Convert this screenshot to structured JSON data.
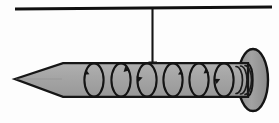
{
  "figure": {
    "caption": "",
    "background_color": "#fdfdfd",
    "canvas": {
      "width": 279,
      "height": 123
    }
  },
  "colors": {
    "outline": "#1a1a1a",
    "body_fill": "#a3a3a3",
    "head_fill": "#9b9b9b",
    "head_rim": "#141414",
    "support_line": "#101010",
    "string": "#151515",
    "loop_stroke": "#141414",
    "background": "#fdfdfd"
  },
  "elements": {
    "support_line": {
      "name": "horizontal support line",
      "x1": 15,
      "y1": 9,
      "x2": 272,
      "y2": 7,
      "thickness": 3
    },
    "string": {
      "name": "vertical suspension string",
      "x": 152,
      "y_top": 9,
      "y_bottom": 64,
      "thickness": 2,
      "anchor_cap_width": 9
    },
    "nail_shaft": {
      "name": "nail shaft",
      "top_y": 63,
      "bottom_y": 97,
      "left_x": 57,
      "right_x": 248
    },
    "nail_tip": {
      "name": "nail point",
      "apex_x": 15,
      "apex_y": 79,
      "base_x": 62
    },
    "nail_head": {
      "name": "nail head",
      "center_x": 253,
      "center_y": 80,
      "radius_x": 15,
      "radius_y": 31
    },
    "shank_grooves": {
      "name": "shank ring grooves",
      "count": 3,
      "x_positions": [
        238,
        242,
        246
      ]
    }
  },
  "circulation_loops": {
    "name": "circulation direction loops",
    "count": 6,
    "radius_x": 10,
    "radius_y": 17,
    "direction": "counterclockwise",
    "items": [
      {
        "label": "loop-1",
        "cx": 94,
        "cy": 80,
        "arrow": "top-left"
      },
      {
        "label": "loop-2",
        "cx": 121,
        "cy": 80,
        "arrow": "top-right"
      },
      {
        "label": "loop-3",
        "cx": 147,
        "cy": 80,
        "arrow": "mid-left"
      },
      {
        "label": "loop-4",
        "cx": 173,
        "cy": 80,
        "arrow": "top-right"
      },
      {
        "label": "loop-5",
        "cx": 199,
        "cy": 80,
        "arrow": "top-right"
      },
      {
        "label": "loop-6",
        "cx": 224,
        "cy": 80,
        "arrow": "mid-left"
      }
    ]
  },
  "labels": {
    "none": ""
  }
}
